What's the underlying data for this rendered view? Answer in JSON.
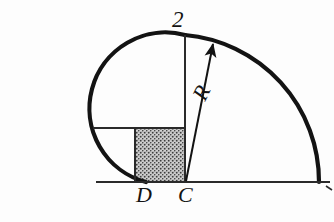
{
  "figure": {
    "background_color": "#fdfdfd",
    "ink_color": "#131313",
    "labels": {
      "top_dimension": "2",
      "point_d": "D",
      "point_c": "C",
      "radius": "R"
    },
    "stipple": {
      "name": "dotted-fill",
      "fill_color": "#d8d8d8",
      "dot_color": "#3a3a3a"
    }
  },
  "geometry": {
    "baseline": {
      "x1": 96,
      "y1": 182,
      "x2": 330,
      "y2": 182
    },
    "center_c": {
      "x": 185,
      "y": 182
    },
    "point_d": {
      "x": 135,
      "y": 182
    },
    "apex_two": {
      "x": 185,
      "y": 35
    },
    "large_arc_radius": 147,
    "small_circle_center": {
      "x": 135,
      "y": 128
    },
    "small_circle_radius": 53,
    "vertical_line": {
      "x": 185,
      "y_top": 35,
      "y_bottom": 182
    },
    "horizontal_line": {
      "y": 128,
      "x1": 93,
      "x2": 185
    },
    "square": {
      "x": 135,
      "y": 128,
      "w": 50,
      "h": 54
    },
    "radius_arrow": {
      "x1": 186,
      "y1": 181,
      "x2": 213,
      "y2": 43
    }
  },
  "annotations": {
    "arrow_head_name": "radius-arrow-head",
    "tick_mark_name": "baseline-end-tick"
  }
}
